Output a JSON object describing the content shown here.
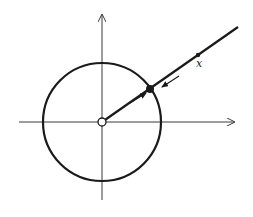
{
  "diagram": {
    "colors": {
      "stroke": "#1a1a1a",
      "axis": "#3a3a3a",
      "background": "#ffffff"
    },
    "origin": {
      "x": 102,
      "y": 122
    },
    "circle": {
      "cx": 102,
      "cy": 122,
      "r": 59
    },
    "axes": {
      "horizontal": {
        "x1": 19,
        "x2": 234,
        "y": 122
      },
      "vertical": {
        "x": 102,
        "y1": 200,
        "y2": 15
      }
    },
    "ray": {
      "x1": 102,
      "y1": 122,
      "x2": 238,
      "y2": 27
    },
    "points": [
      {
        "name": "origin",
        "x": 102,
        "y": 122,
        "style": "open"
      },
      {
        "name": "projection-on-circle",
        "x": 150,
        "y": 89,
        "style": "filled"
      },
      {
        "name": "x",
        "x": 198,
        "y": 55,
        "style": "small-filled"
      }
    ],
    "labels": {
      "x": "x"
    },
    "arrows": [
      {
        "name": "outward-arrow",
        "x1": 130,
        "y1": 103,
        "x2": 146,
        "y2": 93
      },
      {
        "name": "inward-arrow",
        "x1": 179,
        "y1": 76,
        "x2": 162,
        "y2": 87
      }
    ]
  }
}
